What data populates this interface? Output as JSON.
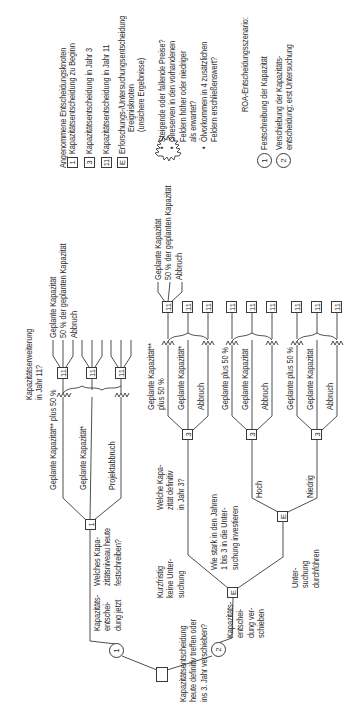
{
  "root": {
    "question": [
      "Kapazitätsentscheidung",
      "heute definitiv treffen oder",
      "ins 3. Jahr verschieben?"
    ]
  },
  "scenario1": {
    "circle_label": "1",
    "branch_label": [
      "Kapazitäts-",
      "entschei-",
      "dung jetzt"
    ],
    "node_label": "1",
    "node_question": [
      "Welches Kapa-",
      "zitätsniveau heute",
      "festschreiben?"
    ],
    "branches": [
      {
        "label": "Geplante Kapazität** plus 50 %"
      },
      {
        "label": "Geplante Kapazität*"
      },
      {
        "label": "Projektabbruch"
      }
    ],
    "year11_question": [
      "Kapazitätserweiterung",
      "in Jahr 11?"
    ],
    "year11_node_label": "11",
    "year11_options": [
      "Geplante Kapazität",
      "50 % der geplanten Kapazität",
      "Abbruch"
    ]
  },
  "scenario2": {
    "circle_label": "2",
    "branch_label": [
      "Kapazitäts-",
      "entschei-",
      "dung ver-",
      "schieben"
    ],
    "e_node_label": "E",
    "e_question": [
      "Wie stark in den Jahren",
      "1 bis 3 in die Unter-",
      "suchung investieren"
    ],
    "no_study_label": [
      "Kurzfristig",
      "keine Unter-",
      "suchung"
    ],
    "study_label": [
      "Unter-",
      "suchung",
      "durchführen"
    ],
    "year3_question": [
      "Welche Kapa-",
      "zität definitiv",
      "in Jahr 3?"
    ],
    "result_high": "Hoch",
    "result_low": "Niedrig",
    "year3_node_label": "3",
    "year11_node_label": "11",
    "groups": [
      {
        "branches": [
          "Geplante Kapazität**",
          "plus 50 %",
          "Geplante Kapazität*",
          "Abbruch"
        ]
      },
      {
        "branches": [
          "Geplante plus 50 %",
          "Geplante Kapazität",
          "Abbruch"
        ]
      },
      {
        "branches": [
          "Geplante plus 50 %",
          "Geplante Kapazität",
          "Abbruch"
        ]
      }
    ],
    "year11_options": [
      "Geplante Kapazität",
      "50 % der geplanten Kapazität",
      "Abbruch"
    ]
  },
  "legend": {
    "decision_title": "Angenommene Entscheidungsknoten",
    "decision_items": [
      {
        "box": "1",
        "label": "Kapazitätsentscheidung zu Beginn"
      },
      {
        "box": "3",
        "label": "Kapazitätsentscheidung in Jahr 3"
      },
      {
        "box": "11",
        "label": "Kapazitätsentscheidung in Jahr 11"
      },
      {
        "box": "E",
        "label": "Erforschungs-/Untersuchungsentscheidung"
      }
    ],
    "event_title": "Ereignisknoten",
    "event_subtitle": "(unsichere Ergebnisse)",
    "event_items": [
      [
        "Steigende oder fallende Preise?"
      ],
      [
        "Ölreserven in den vorhandenen",
        "Feldern höher oder niedriger",
        "als erwartet?"
      ],
      [
        "Ölvorkommen in 4 zusätzlichen",
        "Feldern erschließenswert?"
      ]
    ],
    "roa_title": "ROA-Entscheidungsszenario:",
    "roa_items": [
      {
        "circle": "1",
        "label": [
          "Festschreibung der Kapazität"
        ]
      },
      {
        "circle": "2",
        "label": [
          "Verschiebung der Kapazitäts-",
          "entscheidung; erst Untersuchung"
        ]
      }
    ]
  }
}
